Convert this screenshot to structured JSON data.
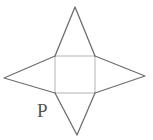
{
  "figure": {
    "label": "P",
    "colors": {
      "background": "#ffffff",
      "triangle-stroke": "#6e6e6e",
      "square-stroke": "#b4b4b4",
      "label-color": "#555555"
    },
    "shapes": {
      "square": {
        "points": "55,56 95,56 95,93 55,93"
      },
      "triangle_top": {
        "points": "55,56 75,7 95,56"
      },
      "triangle_right": {
        "points": "95,56 145,76 95,93"
      },
      "triangle_bottom": {
        "points": "95,93 77,135 55,93"
      },
      "triangle_left": {
        "points": "55,93 4,78 55,56"
      }
    }
  }
}
